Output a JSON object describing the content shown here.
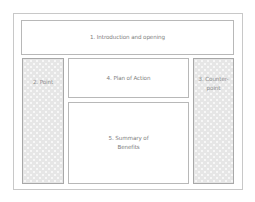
{
  "diagram": {
    "type": "layout-wireframe",
    "sections": [
      {
        "id": 1,
        "label": "1. Introduction and opening",
        "fill": "plain"
      },
      {
        "id": 2,
        "label": "2. Point",
        "fill": "checkered"
      },
      {
        "id": 3,
        "label": "3. Counter-point",
        "label_lines": [
          "3. Counter-",
          "point"
        ],
        "fill": "checkered"
      },
      {
        "id": 4,
        "label": "4. Plan of Action",
        "fill": "plain"
      },
      {
        "id": 5,
        "label": "5. Summary of Benefits",
        "label_lines": [
          "5. Summary of",
          "Benefits"
        ],
        "fill": "plain"
      }
    ]
  },
  "colors": {
    "border": "#b8b8b8",
    "checkered_fill": "#e6e6e6",
    "text": "#7e7e7e",
    "background": "#ffffff"
  }
}
